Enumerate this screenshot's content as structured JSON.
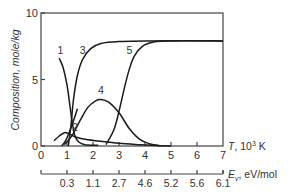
{
  "chart_data": {
    "type": "line",
    "title": "",
    "xlabel": "T, 10³ K",
    "ylabel": "Composition, mole/kg",
    "secondary_xlabel": "Eᵥ, eV/mol",
    "xlim": [
      0,
      7
    ],
    "ylim": [
      0,
      10
    ],
    "x_ticks": [
      0,
      1,
      2,
      3,
      4,
      5,
      6,
      7
    ],
    "y_ticks": [
      0,
      5,
      10
    ],
    "secondary_x_ticks": [
      {
        "at": 1,
        "label": "0.3"
      },
      {
        "at": 2,
        "label": "1.1"
      },
      {
        "at": 3,
        "label": "2.7"
      },
      {
        "at": 4,
        "label": "4.6"
      },
      {
        "at": 5,
        "label": "5.2"
      },
      {
        "at": 6,
        "label": "5.6"
      },
      {
        "at": 7,
        "label": "6.1"
      }
    ],
    "grid": false,
    "legend": "curve labels inline",
    "series": [
      {
        "name": "1",
        "label_at": [
          0.75,
          6.9
        ],
        "points": [
          [
            0.7,
            6.6
          ],
          [
            0.85,
            5.9
          ],
          [
            1.0,
            4.6
          ],
          [
            1.1,
            3.2
          ],
          [
            1.2,
            1.8
          ],
          [
            1.3,
            0.8
          ],
          [
            1.45,
            0.3
          ],
          [
            1.7,
            0.1
          ],
          [
            2.2,
            0.05
          ]
        ]
      },
      {
        "name": "2",
        "label_at": [
          1.3,
          1.1
        ],
        "points": [
          [
            0.5,
            0.4
          ],
          [
            0.7,
            0.75
          ],
          [
            0.9,
            1.0
          ],
          [
            1.05,
            0.95
          ],
          [
            1.3,
            0.7
          ],
          [
            1.7,
            0.5
          ],
          [
            2.3,
            0.35
          ],
          [
            3.0,
            0.2
          ],
          [
            3.8,
            0.1
          ],
          [
            4.5,
            0.03
          ],
          [
            5,
            0
          ]
        ]
      },
      {
        "name": "2b",
        "label_at": null,
        "points": [
          [
            0.8,
            0
          ],
          [
            0.95,
            0.4
          ],
          [
            1.1,
            1.1
          ],
          [
            1.25,
            1.9
          ],
          [
            1.4,
            2.8
          ]
        ]
      },
      {
        "name": "3",
        "label_at": [
          1.6,
          6.9
        ],
        "points": [
          [
            1.05,
            0
          ],
          [
            1.15,
            1.5
          ],
          [
            1.25,
            3.5
          ],
          [
            1.4,
            5.3
          ],
          [
            1.6,
            6.5
          ],
          [
            1.9,
            7.3
          ],
          [
            2.3,
            7.7
          ],
          [
            3.0,
            7.85
          ],
          [
            4.0,
            7.9
          ],
          [
            7.0,
            7.9
          ]
        ]
      },
      {
        "name": "4",
        "label_at": [
          2.3,
          3.9
        ],
        "points": [
          [
            0.9,
            0.1
          ],
          [
            1.2,
            0.8
          ],
          [
            1.5,
            1.9
          ],
          [
            1.8,
            2.9
          ],
          [
            2.1,
            3.4
          ],
          [
            2.3,
            3.5
          ],
          [
            2.6,
            3.3
          ],
          [
            3.0,
            2.5
          ],
          [
            3.4,
            1.3
          ],
          [
            3.8,
            0.5
          ],
          [
            4.2,
            0.15
          ],
          [
            4.6,
            0.02
          ]
        ]
      },
      {
        "name": "5",
        "label_at": [
          3.4,
          6.9
        ],
        "points": [
          [
            2.5,
            0.1
          ],
          [
            2.8,
            1.2
          ],
          [
            3.0,
            2.6
          ],
          [
            3.2,
            4.3
          ],
          [
            3.4,
            5.8
          ],
          [
            3.6,
            6.8
          ],
          [
            3.9,
            7.5
          ],
          [
            4.3,
            7.8
          ],
          [
            4.8,
            7.9
          ],
          [
            7.0,
            7.9
          ]
        ]
      }
    ]
  },
  "labels": {
    "y_axis_title": "Composition, mole/kg",
    "x_axis_title_T": "T",
    "x_axis_title_unit": ", 10",
    "x_axis_title_exp": "3",
    "x_axis_title_K": " K",
    "x2_axis_title_E": "E",
    "x2_axis_title_sub": "v",
    "x2_axis_title_unit": ", eV/mol"
  }
}
